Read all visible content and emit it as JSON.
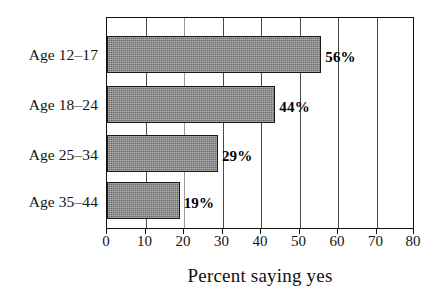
{
  "chart_data": {
    "type": "bar",
    "orientation": "horizontal",
    "title": "",
    "subtitle": "",
    "xlabel": "Percent saying yes",
    "ylabel": "",
    "xlim": [
      0,
      80
    ],
    "ylim": null,
    "grid": true,
    "legend": null,
    "legend_position": "none",
    "categories": [
      "Age 12–17",
      "Age 18–24",
      "Age 25–34",
      "Age 35–44"
    ],
    "values": [
      56,
      44,
      29,
      19
    ],
    "data_labels": [
      "56%",
      "44%",
      "29%",
      "19%"
    ],
    "xticks": [
      0,
      10,
      20,
      30,
      40,
      50,
      60,
      70,
      80
    ],
    "xticklabels": [
      "0",
      "10",
      "20",
      "30",
      "40",
      "50",
      "60",
      "70",
      "80"
    ],
    "bar_color": "#878787",
    "bar_edge_color": "#1a1a1a",
    "frame_color": "#101010",
    "gridline_color": "#4a4a4a",
    "background_color": "#ffffff"
  },
  "axis": {
    "x_title": "Percent saying yes",
    "tick_labels": [
      "0",
      "10",
      "20",
      "30",
      "40",
      "50",
      "60",
      "70",
      "80"
    ]
  },
  "categories": [
    {
      "label": "Age 12–17",
      "value": 56,
      "data_label": "56%"
    },
    {
      "label": "Age 18–24",
      "value": 44,
      "data_label": "44%"
    },
    {
      "label": "Age 25–34",
      "value": 29,
      "data_label": "29%"
    },
    {
      "label": "Age 35–44",
      "value": 19,
      "data_label": "19%"
    }
  ]
}
